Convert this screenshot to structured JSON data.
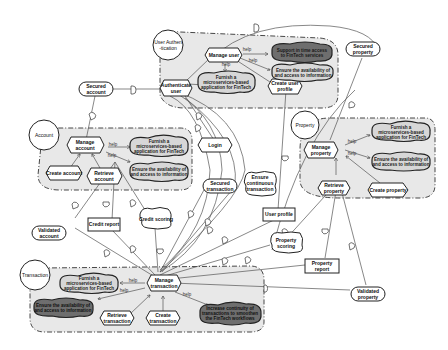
{
  "diagram": {
    "type": "iStar strategic dependency / rationale model",
    "actors": [
      {
        "id": "user_auth",
        "label_line1": "User Authen",
        "label_line2": "-tication"
      },
      {
        "id": "account",
        "label": "Account"
      },
      {
        "id": "property",
        "label": "Property"
      },
      {
        "id": "transaction",
        "label": "Transaction"
      }
    ],
    "link_label": "help",
    "user_auth": {
      "tasks": {
        "manage_user": "Manage user",
        "authenticate_user_1": "Authenticate",
        "authenticate_user_2": "user",
        "create_user_profile_1": "Create user",
        "create_user_profile_2": "profile"
      },
      "softgoals": {
        "support_1": "Support in time access",
        "support_2": "to FinTech services",
        "furnish_1": "Furnish a",
        "furnish_2": "microservices-based",
        "furnish_3": "application for FinTech",
        "ensure_1": "Ensure the availability of",
        "ensure_2": "and access to information"
      }
    },
    "account": {
      "tasks": {
        "manage_1": "Manage",
        "manage_2": "account",
        "create": "Create account",
        "retrieve_1": "Retrieve",
        "retrieve_2": "account"
      },
      "softgoals": {
        "furnish_1": "Furnish a",
        "furnish_2": "microservices-based",
        "furnish_3": "application for FinTech",
        "ensure_1": "Ensure the availability of",
        "ensure_2": "and access to information"
      }
    },
    "property": {
      "tasks": {
        "manage_1": "Manage",
        "manage_2": "property",
        "retrieve_1": "Retrieve",
        "retrieve_2": "property",
        "create": "Create property"
      },
      "softgoals": {
        "furnish_1": "Furnish a",
        "furnish_2": "microservices-based",
        "furnish_3": "application for FinTech",
        "ensure_1": "Ensure the availability of",
        "ensure_2": "and access to information"
      }
    },
    "transaction": {
      "tasks": {
        "manage_1": "Manage",
        "manage_2": "transaction",
        "retrieve_1": "Retrieve",
        "retrieve_2": "transaction",
        "create_1": "Create",
        "create_2": "transaction"
      },
      "softgoals": {
        "furnish_1": "Furnish a",
        "furnish_2": "microservices-based",
        "furnish_3": "application for FinTech",
        "ensure_1": "Ensure the availability of",
        "ensure_2": "and access to information",
        "increase_1": "Increase continuity of",
        "increase_2": "transactions to smoothen",
        "increase_3": "the FinTech workflows"
      }
    },
    "dependums": {
      "secured_account_1": "Secured",
      "secured_account_2": "account",
      "secured_property_1": "Secured",
      "secured_property_2": "property",
      "login": "Login",
      "secured_transaction_1": "Secured",
      "secured_transaction_2": "transaction",
      "ensure_continuous_1": "Ensure",
      "ensure_continuous_2": "continuous",
      "ensure_continuous_3": "transaction",
      "user_profile": "User profile",
      "credit_report": "Credit report",
      "credit_scoring": "Credit scoring",
      "validated_account_1": "Validated",
      "validated_account_2": "account",
      "property_scoring_1": "Property",
      "property_scoring_2": "scoring",
      "property_report_1": "Property",
      "property_report_2": "report",
      "validated_property_1": "Validated",
      "validated_property_2": "property"
    }
  }
}
